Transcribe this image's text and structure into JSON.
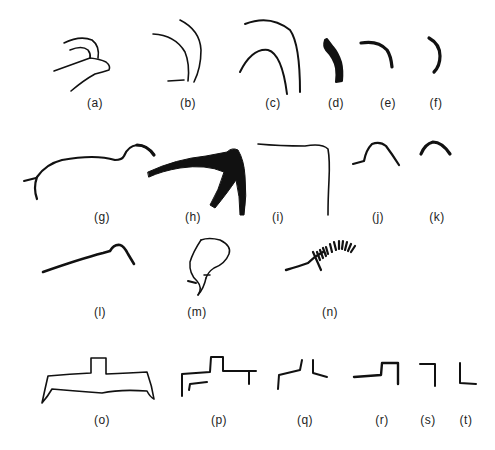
{
  "figure": {
    "background": "#ffffff",
    "ink": "#111111",
    "panels": [
      {
        "id": "a",
        "label": "(a)",
        "x": 95,
        "y": 106
      },
      {
        "id": "b",
        "label": "(b)",
        "x": 188,
        "y": 106
      },
      {
        "id": "c",
        "label": "(c)",
        "x": 273,
        "y": 106
      },
      {
        "id": "d",
        "label": "(d)",
        "x": 336,
        "y": 106
      },
      {
        "id": "e",
        "label": "(e)",
        "x": 388,
        "y": 106
      },
      {
        "id": "f",
        "label": "(f)",
        "x": 436,
        "y": 106
      },
      {
        "id": "g",
        "label": "(g)",
        "x": 102,
        "y": 210
      },
      {
        "id": "h",
        "label": "(h)",
        "x": 195,
        "y": 210
      },
      {
        "id": "i",
        "label": "(i)",
        "x": 278,
        "y": 210
      },
      {
        "id": "j",
        "label": "(j)",
        "x": 378,
        "y": 210
      },
      {
        "id": "k",
        "label": "(k)",
        "x": 437,
        "y": 210
      },
      {
        "id": "l",
        "label": "(l)",
        "x": 100,
        "y": 306
      },
      {
        "id": "m",
        "label": "(m)",
        "x": 197,
        "y": 306
      },
      {
        "id": "n",
        "label": "(n)",
        "x": 330,
        "y": 306
      },
      {
        "id": "o",
        "label": "(o)",
        "x": 102,
        "y": 420
      },
      {
        "id": "p",
        "label": "(p)",
        "x": 219,
        "y": 420
      },
      {
        "id": "q",
        "label": "(q)",
        "x": 306,
        "y": 420
      },
      {
        "id": "r",
        "label": "(r)",
        "x": 382,
        "y": 420
      },
      {
        "id": "s",
        "label": "(s)",
        "x": 428,
        "y": 420
      },
      {
        "id": "t",
        "label": "(t)",
        "x": 466,
        "y": 420
      }
    ]
  }
}
